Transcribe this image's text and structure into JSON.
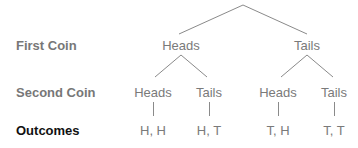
{
  "rows": {
    "first_coin": "First Coin",
    "second_coin": "Second Coin",
    "outcomes": "Outcomes"
  },
  "tree": {
    "level1": [
      "Heads",
      "Tails"
    ],
    "level2": [
      "Heads",
      "Tails",
      "Heads",
      "Tails"
    ],
    "outcomes": [
      "H, H",
      "H, T",
      "T, H",
      "T, T"
    ]
  },
  "colors": {
    "line": "#8a8a8a",
    "label": "#7a7a7a",
    "row_label": "#777777",
    "outcomes_label": "#111111"
  }
}
